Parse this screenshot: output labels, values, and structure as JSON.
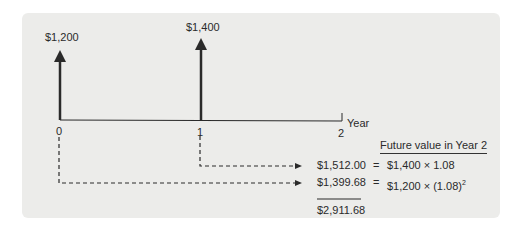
{
  "diagram": {
    "type": "cash-flow-timeline",
    "cash_flows": [
      {
        "period": "0",
        "amount_label": "$1,200"
      },
      {
        "period": "1",
        "amount_label": "$1,400"
      }
    ],
    "axis": {
      "ticks": [
        "0",
        "1",
        "2"
      ],
      "label": "Year"
    },
    "future_value": {
      "header": "Future value in Year 2",
      "rows": [
        {
          "value": "$1,512.00",
          "equals": "=",
          "formula_base": "$1,400 × 1.08",
          "exponent": ""
        },
        {
          "value": "$1,399.68",
          "equals": "=",
          "formula_base": "$1,200 × (1.08)",
          "exponent": "2"
        }
      ],
      "total": "$2,911.68"
    },
    "colors": {
      "panel": "#ececea",
      "ink": "#2a2a2a"
    }
  }
}
